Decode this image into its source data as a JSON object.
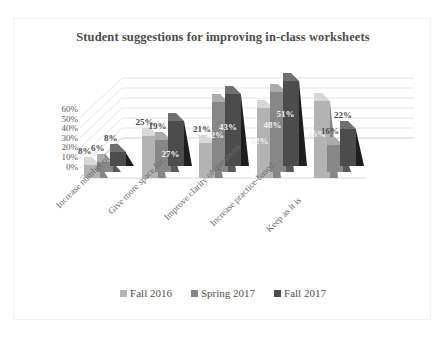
{
  "chart_data": {
    "type": "bar",
    "title": "Student suggestions for improving in-class worksheets",
    "xlabel": "",
    "ylabel": "",
    "ylim": [
      0,
      60
    ],
    "ytick_labels": [
      "60%",
      "50%",
      "40%",
      "30%",
      "20%",
      "10%",
      "0%"
    ],
    "grid": true,
    "legend_position": "bottom",
    "three_d": true,
    "categories": [
      "Increase number of…",
      "Give more space for…",
      "Improve clarity of questions",
      "Increase practice-based…",
      "Keep as it is"
    ],
    "series": [
      {
        "name": "Fall 2016",
        "color": "#b3b3b3",
        "values": [
          8,
          25,
          21,
          42,
          46
        ]
      },
      {
        "name": "Spring 2017",
        "color": "#878787",
        "values": [
          6,
          19,
          42,
          48,
          16
        ]
      },
      {
        "name": "Fall 2017",
        "color": "#4c4c4c",
        "values": [
          8,
          27,
          43,
          51,
          22
        ]
      }
    ],
    "data_labels": [
      [
        "8%",
        "6%",
        "8%"
      ],
      [
        "25%",
        "19%",
        "27%"
      ],
      [
        "21%",
        "42%",
        "43%"
      ],
      [
        "42%",
        "48%",
        "51%"
      ],
      [
        "46%",
        "16%",
        "22%"
      ]
    ]
  },
  "legend": {
    "items": [
      {
        "label": "Fall 2016"
      },
      {
        "label": "Spring 2017"
      },
      {
        "label": "Fall 2017"
      }
    ]
  },
  "artifacts": {
    "top_fragment_left": "",
    "top_fragment_right": ""
  }
}
